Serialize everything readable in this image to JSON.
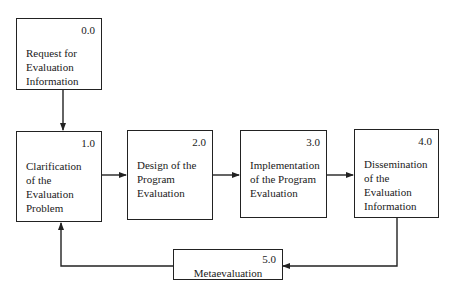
{
  "diagram": {
    "type": "flowchart",
    "nodes": [
      {
        "id": "0.0",
        "number": "0.0",
        "label": "Request for\nEvaluation\nInformation"
      },
      {
        "id": "1.0",
        "number": "1.0",
        "label": "Clarification\nof the\nEvaluation\nProblem"
      },
      {
        "id": "2.0",
        "number": "2.0",
        "label": "Design of the\nProgram\nEvaluation"
      },
      {
        "id": "3.0",
        "number": "3.0",
        "label": "Implementation\nof the Program\nEvaluation"
      },
      {
        "id": "4.0",
        "number": "4.0",
        "label": "Dissemination\nof the\nEvaluation\nInformation"
      },
      {
        "id": "5.0",
        "number": "5.0",
        "label": "Metaevaluation"
      }
    ],
    "edges": [
      {
        "from": "0.0",
        "to": "1.0"
      },
      {
        "from": "1.0",
        "to": "2.0"
      },
      {
        "from": "2.0",
        "to": "3.0"
      },
      {
        "from": "3.0",
        "to": "4.0"
      },
      {
        "from": "4.0",
        "to": "5.0"
      },
      {
        "from": "5.0",
        "to": "1.0"
      }
    ],
    "colors": {
      "line": "#222222",
      "background": "#ffffff"
    }
  }
}
